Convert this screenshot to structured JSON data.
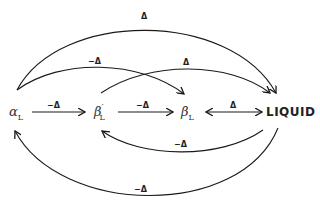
{
  "nodes": {
    "alpha": {
      "symbol": "α",
      "subscript": "L",
      "prime": ""
    },
    "beta_prime": {
      "symbol": "β",
      "subscript": "L",
      "prime": "′"
    },
    "beta": {
      "symbol": "β",
      "subscript": "L",
      "prime": ""
    },
    "liquid": {
      "label": "LIQUID"
    }
  },
  "edges": [
    {
      "id": "alpha-to-beta-prime",
      "from": "α_L",
      "to": "β′_L",
      "label": "−Δ"
    },
    {
      "id": "beta-prime-to-beta",
      "from": "β′_L",
      "to": "β_L",
      "label": "−Δ"
    },
    {
      "id": "beta-liquid",
      "from": "β_L",
      "to": "LIQUID",
      "label": "Δ",
      "bidirectional": true
    },
    {
      "id": "alpha-to-liquid",
      "from": "α_L",
      "to": "LIQUID",
      "label": "Δ"
    },
    {
      "id": "alpha-to-beta",
      "from": "α_L",
      "to": "β_L",
      "label": "−Δ"
    },
    {
      "id": "beta-prime-to-liquid",
      "from": "β′_L",
      "to": "LIQUID",
      "label": "Δ"
    },
    {
      "id": "liquid-to-beta-prime",
      "from": "LIQUID",
      "to": "β′_L",
      "label": "−Δ"
    },
    {
      "id": "liquid-to-alpha",
      "from": "LIQUID",
      "to": "α_L",
      "label": "−Δ"
    }
  ],
  "colors": {
    "stroke": "#1a1a1a",
    "text": "#222222",
    "background": "#ffffff"
  }
}
